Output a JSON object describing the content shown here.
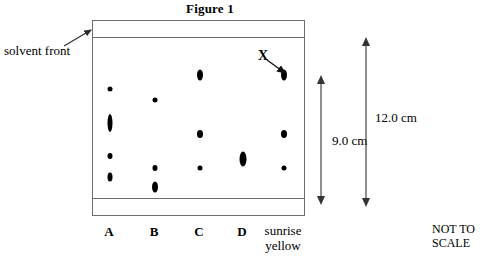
{
  "figure": {
    "title": "Figure 1",
    "note_line1": "NOT TO",
    "note_line2": "SCALE"
  },
  "annotations": {
    "solvent_front_label": "solvent front",
    "spot_x_label": "X"
  },
  "dimensions": {
    "plate_to_baseline": "9.0 cm",
    "total_height": "12.0 cm"
  },
  "lanes": [
    {
      "id": "A",
      "label": "A",
      "label_line2": "",
      "x": 109,
      "bold": true
    },
    {
      "id": "B",
      "label": "B",
      "label_line2": "",
      "x": 154,
      "bold": true
    },
    {
      "id": "C",
      "label": "C",
      "label_line2": "",
      "x": 199,
      "bold": true
    },
    {
      "id": "D",
      "label": "D",
      "label_line2": "",
      "x": 242,
      "bold": true
    },
    {
      "id": "sunrise-yellow",
      "label": "sunrise",
      "label_line2": "yellow",
      "x": 283,
      "bold": false
    }
  ],
  "chart_data": {
    "type": "scatter",
    "title": "Figure 1",
    "plate": {
      "left": 92,
      "top": 20,
      "width": 213,
      "height": 196,
      "solvent_front_y": 36,
      "baseline_y": 200
    },
    "spots": [
      {
        "lane": "A",
        "x": 109,
        "y": 88,
        "w": 5,
        "h": 5,
        "label": ""
      },
      {
        "lane": "A",
        "x": 109,
        "y": 122,
        "w": 5,
        "h": 18,
        "label": ""
      },
      {
        "lane": "A",
        "x": 109,
        "y": 155,
        "w": 5,
        "h": 6,
        "label": ""
      },
      {
        "lane": "A",
        "x": 109,
        "y": 176,
        "w": 5,
        "h": 9,
        "label": ""
      },
      {
        "lane": "B",
        "x": 154,
        "y": 99,
        "w": 5,
        "h": 5,
        "label": ""
      },
      {
        "lane": "B",
        "x": 154,
        "y": 167,
        "w": 5,
        "h": 6,
        "label": ""
      },
      {
        "lane": "B",
        "x": 154,
        "y": 186,
        "w": 6,
        "h": 11,
        "label": ""
      },
      {
        "lane": "C",
        "x": 199,
        "y": 74,
        "w": 6,
        "h": 11,
        "label": ""
      },
      {
        "lane": "C",
        "x": 199,
        "y": 133,
        "w": 6,
        "h": 8,
        "label": ""
      },
      {
        "lane": "C",
        "x": 199,
        "y": 167,
        "w": 5,
        "h": 5,
        "label": ""
      },
      {
        "lane": "D",
        "x": 242,
        "y": 158,
        "w": 7,
        "h": 15,
        "label": ""
      },
      {
        "lane": "sunrise-yellow",
        "x": 283,
        "y": 74,
        "w": 6,
        "h": 11,
        "label": "X"
      },
      {
        "lane": "sunrise-yellow",
        "x": 283,
        "y": 133,
        "w": 6,
        "h": 8,
        "label": ""
      },
      {
        "lane": "sunrise-yellow",
        "x": 283,
        "y": 167,
        "w": 5,
        "h": 5,
        "label": ""
      }
    ],
    "measurements": [
      {
        "name": "plate_to_baseline",
        "value": 9.0,
        "unit": "cm",
        "text": "9.0 cm"
      },
      {
        "name": "total_height",
        "value": 12.0,
        "unit": "cm",
        "text": "12.0 cm"
      }
    ]
  }
}
